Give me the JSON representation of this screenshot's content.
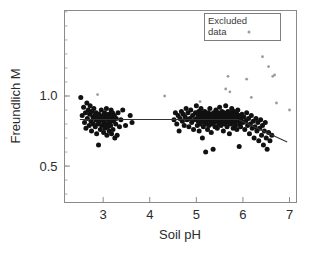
{
  "chart_data": {
    "type": "scatter",
    "title": "",
    "xlabel": "Soil pH",
    "ylabel": "Freundlich M",
    "xlim": [
      2.17,
      7.15
    ],
    "ylim": [
      0.24,
      1.61
    ],
    "xticks": [
      3,
      4,
      5,
      6,
      7
    ],
    "xtick_labels": [
      "3",
      "4",
      "5",
      "6",
      "7"
    ],
    "yticks": [
      0.5,
      1.0
    ],
    "ytick_labels": [
      "0.5",
      "1.0"
    ],
    "minor_ticks": true,
    "grid": false,
    "legend": {
      "position": "top-right",
      "entries": [
        {
          "label_line1": "Excluded",
          "label_line2": "data",
          "marker": "small-dot",
          "color": "#9b9b9b"
        }
      ]
    },
    "series": [
      {
        "name": "Freundlich M (included)",
        "marker": "filled-circle",
        "color": "#111111",
        "points": [
          [
            2.52,
            0.99
          ],
          [
            2.55,
            0.86
          ],
          [
            2.58,
            0.92
          ],
          [
            2.6,
            0.81
          ],
          [
            2.62,
            0.88
          ],
          [
            2.63,
            0.77
          ],
          [
            2.65,
            0.95
          ],
          [
            2.66,
            0.84
          ],
          [
            2.68,
            0.9
          ],
          [
            2.7,
            0.79
          ],
          [
            2.71,
            0.87
          ],
          [
            2.72,
            0.93
          ],
          [
            2.74,
            0.82
          ],
          [
            2.75,
            0.75
          ],
          [
            2.76,
            0.89
          ],
          [
            2.78,
            0.85
          ],
          [
            2.79,
            0.8
          ],
          [
            2.8,
            0.91
          ],
          [
            2.82,
            0.86
          ],
          [
            2.83,
            0.78
          ],
          [
            2.84,
            0.83
          ],
          [
            2.85,
            0.88
          ],
          [
            2.86,
            0.73
          ],
          [
            2.88,
            0.84
          ],
          [
            2.89,
            0.8
          ],
          [
            2.9,
            0.65
          ],
          [
            2.91,
            0.87
          ],
          [
            2.92,
            0.82
          ],
          [
            2.94,
            0.76
          ],
          [
            2.95,
            0.85
          ],
          [
            2.96,
            0.9
          ],
          [
            2.97,
            0.79
          ],
          [
            2.98,
            0.83
          ],
          [
            3.0,
            0.86
          ],
          [
            3.01,
            0.74
          ],
          [
            3.02,
            0.81
          ],
          [
            3.03,
            0.88
          ],
          [
            3.04,
            0.77
          ],
          [
            3.05,
            0.84
          ],
          [
            3.06,
            0.8
          ],
          [
            3.07,
            0.91
          ],
          [
            3.08,
            0.72
          ],
          [
            3.09,
            0.86
          ],
          [
            3.1,
            0.78
          ],
          [
            3.11,
            0.83
          ],
          [
            3.12,
            0.87
          ],
          [
            3.13,
            0.75
          ],
          [
            3.14,
            0.81
          ],
          [
            3.15,
            0.85
          ],
          [
            3.16,
            0.79
          ],
          [
            3.17,
            0.9
          ],
          [
            3.18,
            0.73
          ],
          [
            3.19,
            0.84
          ],
          [
            3.2,
            0.88
          ],
          [
            3.21,
            0.76
          ],
          [
            3.22,
            0.82
          ],
          [
            3.24,
            0.86
          ],
          [
            3.25,
            0.7
          ],
          [
            3.27,
            0.8
          ],
          [
            3.28,
            0.84
          ],
          [
            3.3,
            0.72
          ],
          [
            3.32,
            0.88
          ],
          [
            3.35,
            0.78
          ],
          [
            3.38,
            0.83
          ],
          [
            3.42,
            0.9
          ],
          [
            3.48,
            0.79
          ],
          [
            3.58,
            0.86
          ],
          [
            3.62,
            0.81
          ],
          [
            4.52,
            0.83
          ],
          [
            4.55,
            0.88
          ],
          [
            4.58,
            0.8
          ],
          [
            4.61,
            0.86
          ],
          [
            4.63,
            0.75
          ],
          [
            4.65,
            0.84
          ],
          [
            4.68,
            0.89
          ],
          [
            4.7,
            0.82
          ],
          [
            4.72,
            0.87
          ],
          [
            4.74,
            0.79
          ],
          [
            4.76,
            0.85
          ],
          [
            4.78,
            0.91
          ],
          [
            4.8,
            0.83
          ],
          [
            4.82,
            0.88
          ],
          [
            4.84,
            0.78
          ],
          [
            4.86,
            0.84
          ],
          [
            4.88,
            0.9
          ],
          [
            4.9,
            0.81
          ],
          [
            4.92,
            0.86
          ],
          [
            4.94,
            0.76
          ],
          [
            4.96,
            0.83
          ],
          [
            4.98,
            0.88
          ],
          [
            5.0,
            0.93
          ],
          [
            5.01,
            0.84
          ],
          [
            5.02,
            0.79
          ],
          [
            5.03,
            0.87
          ],
          [
            5.04,
            0.82
          ],
          [
            5.05,
            0.89
          ],
          [
            5.06,
            0.75
          ],
          [
            5.07,
            0.85
          ],
          [
            5.08,
            0.8
          ],
          [
            5.09,
            0.86
          ],
          [
            5.1,
            0.91
          ],
          [
            5.11,
            0.83
          ],
          [
            5.12,
            0.88
          ],
          [
            5.13,
            0.7
          ],
          [
            5.14,
            0.84
          ],
          [
            5.15,
            0.78
          ],
          [
            5.16,
            0.86
          ],
          [
            5.17,
            0.81
          ],
          [
            5.18,
            0.89
          ],
          [
            5.19,
            0.83
          ],
          [
            5.2,
            0.6
          ],
          [
            5.21,
            0.87
          ],
          [
            5.22,
            0.8
          ],
          [
            5.23,
            0.85
          ],
          [
            5.24,
            0.76
          ],
          [
            5.25,
            0.83
          ],
          [
            5.26,
            0.88
          ],
          [
            5.27,
            0.79
          ],
          [
            5.28,
            0.84
          ],
          [
            5.29,
            0.91
          ],
          [
            5.3,
            0.82
          ],
          [
            5.31,
            0.86
          ],
          [
            5.32,
            0.74
          ],
          [
            5.33,
            0.8
          ],
          [
            5.34,
            0.87
          ],
          [
            5.35,
            0.83
          ],
          [
            5.36,
            0.62
          ],
          [
            5.37,
            0.88
          ],
          [
            5.38,
            0.81
          ],
          [
            5.39,
            0.85
          ],
          [
            5.4,
            0.78
          ],
          [
            5.41,
            0.84
          ],
          [
            5.42,
            0.9
          ],
          [
            5.43,
            0.82
          ],
          [
            5.44,
            0.86
          ],
          [
            5.45,
            0.77
          ],
          [
            5.46,
            0.83
          ],
          [
            5.47,
            0.88
          ],
          [
            5.48,
            0.8
          ],
          [
            5.49,
            0.85
          ],
          [
            5.5,
            0.92
          ],
          [
            5.51,
            0.83
          ],
          [
            5.52,
            0.87
          ],
          [
            5.53,
            0.79
          ],
          [
            5.54,
            0.84
          ],
          [
            5.55,
            0.89
          ],
          [
            5.56,
            0.81
          ],
          [
            5.57,
            0.86
          ],
          [
            5.58,
            0.75
          ],
          [
            5.59,
            0.83
          ],
          [
            5.6,
            0.88
          ],
          [
            5.61,
            0.8
          ],
          [
            5.62,
            0.85
          ],
          [
            5.63,
            0.93
          ],
          [
            5.64,
            0.82
          ],
          [
            5.65,
            0.87
          ],
          [
            5.66,
            0.78
          ],
          [
            5.67,
            0.84
          ],
          [
            5.68,
            0.89
          ],
          [
            5.69,
            0.81
          ],
          [
            5.7,
            0.86
          ],
          [
            5.71,
            0.73
          ],
          [
            5.72,
            0.83
          ],
          [
            5.73,
            0.88
          ],
          [
            5.74,
            0.8
          ],
          [
            5.75,
            0.85
          ],
          [
            5.76,
            0.91
          ],
          [
            5.77,
            0.82
          ],
          [
            5.78,
            0.87
          ],
          [
            5.79,
            0.77
          ],
          [
            5.8,
            0.84
          ],
          [
            5.81,
            0.89
          ],
          [
            5.82,
            0.81
          ],
          [
            5.83,
            0.86
          ],
          [
            5.84,
            0.79
          ],
          [
            5.85,
            0.83
          ],
          [
            5.86,
            0.88
          ],
          [
            5.87,
            0.76
          ],
          [
            5.88,
            0.84
          ],
          [
            5.89,
            0.9
          ],
          [
            5.9,
            0.82
          ],
          [
            5.91,
            0.86
          ],
          [
            5.92,
            0.64
          ],
          [
            5.93,
            0.8
          ],
          [
            5.94,
            0.85
          ],
          [
            5.95,
            0.78
          ],
          [
            5.96,
            0.83
          ],
          [
            5.98,
            0.87
          ],
          [
            6.0,
            0.81
          ],
          [
            6.02,
            0.85
          ],
          [
            6.04,
            0.76
          ],
          [
            6.06,
            0.82
          ],
          [
            6.08,
            0.88
          ],
          [
            6.1,
            0.79
          ],
          [
            6.12,
            0.84
          ],
          [
            6.14,
            0.73
          ],
          [
            6.16,
            0.8
          ],
          [
            6.18,
            0.86
          ],
          [
            6.2,
            0.77
          ],
          [
            6.22,
            0.82
          ],
          [
            6.24,
            0.7
          ],
          [
            6.26,
            0.78
          ],
          [
            6.28,
            0.84
          ],
          [
            6.3,
            0.75
          ],
          [
            6.32,
            0.81
          ],
          [
            6.34,
            0.68
          ],
          [
            6.36,
            0.77
          ],
          [
            6.38,
            0.83
          ],
          [
            6.4,
            0.72
          ],
          [
            6.42,
            0.79
          ],
          [
            6.44,
            0.65
          ],
          [
            6.46,
            0.75
          ],
          [
            6.48,
            0.81
          ],
          [
            6.5,
            0.7
          ],
          [
            6.52,
            0.62
          ],
          [
            6.55,
            0.74
          ],
          [
            6.58,
            0.68
          ],
          [
            6.62,
            0.72
          ]
        ]
      },
      {
        "name": "Excluded data",
        "marker": "small-dot",
        "color": "#9b9b9b",
        "points": [
          [
            2.88,
            1.01
          ],
          [
            4.32,
            1.0
          ],
          [
            5.08,
            0.96
          ],
          [
            5.63,
            1.05
          ],
          [
            5.68,
            1.14
          ],
          [
            5.72,
            1.03
          ],
          [
            6.08,
            1.12
          ],
          [
            6.18,
            0.99
          ],
          [
            6.42,
            1.28
          ],
          [
            6.55,
            1.21
          ],
          [
            6.64,
            1.14
          ],
          [
            6.68,
            1.15
          ],
          [
            6.72,
            0.95
          ],
          [
            7.0,
            0.9
          ]
        ]
      }
    ],
    "fit_line": {
      "name": "segmented regression",
      "color": "#333333",
      "segments": [
        {
          "x1": 2.5,
          "y1": 0.832,
          "x2": 5.9,
          "y2": 0.832
        },
        {
          "x1": 5.9,
          "y1": 0.832,
          "x2": 6.95,
          "y2": 0.672
        }
      ]
    }
  }
}
